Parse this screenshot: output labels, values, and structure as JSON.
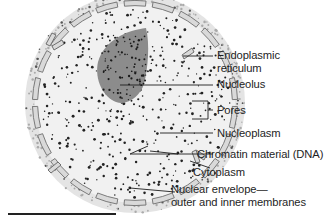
{
  "figure": {
    "colors": {
      "cytoplasm": "#e4e4e4",
      "nucleoplasm": "#f1f1f1",
      "nucleolus": "#8c8c8c",
      "membrane_fill": "#d9d9d9",
      "membrane_stroke": "#6e6e6e",
      "leader_line": "#1e1e1e",
      "text": "#1e1e1e"
    },
    "labels": [
      {
        "id": "endoplasmic-reticulum",
        "text": "Endoplasmic",
        "text2": "reticulum"
      },
      {
        "id": "nucleolus",
        "text": "Nucleolus"
      },
      {
        "id": "pores",
        "text": "Pores"
      },
      {
        "id": "nucleoplasm",
        "text": "Nucleoplasm"
      },
      {
        "id": "chromatin",
        "text": "Chromatin material (DNA)"
      },
      {
        "id": "cytoplasm",
        "text": "Cytoplasm"
      },
      {
        "id": "nuclear-envelope",
        "text": "Nuclear envelope—",
        "text2": "outer and inner membranes"
      }
    ]
  }
}
